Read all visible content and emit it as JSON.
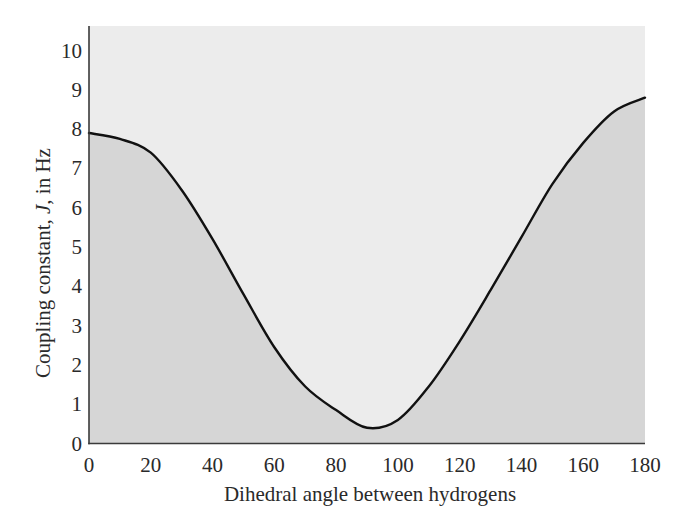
{
  "chart_data": {
    "type": "area",
    "title": "",
    "xlabel": "Dihedral angle between hydrogens",
    "ylabel_parts": [
      "Coupling constant, ",
      "J",
      ", in Hz"
    ],
    "ylabel": "Coupling constant, J, in Hz",
    "xlim": [
      0,
      180
    ],
    "ylim": [
      0,
      10.6
    ],
    "xticks": [
      0,
      20,
      40,
      60,
      80,
      100,
      120,
      140,
      160,
      180
    ],
    "yticks": [
      0,
      1,
      2,
      3,
      4,
      5,
      6,
      7,
      8,
      9,
      10
    ],
    "grid": false,
    "legend": null,
    "series": [
      {
        "name": "Karplus curve",
        "x": [
          0,
          10,
          20,
          30,
          40,
          50,
          60,
          70,
          80,
          90,
          100,
          110,
          120,
          130,
          140,
          150,
          160,
          170,
          180
        ],
        "values": [
          7.9,
          7.75,
          7.4,
          6.45,
          5.2,
          3.8,
          2.45,
          1.45,
          0.85,
          0.4,
          0.6,
          1.45,
          2.6,
          3.9,
          5.25,
          6.6,
          7.65,
          8.45,
          8.8
        ]
      }
    ],
    "colors": {
      "above_curve_fill": "#ececec",
      "below_curve_fill": "#d6d6d6",
      "curve": "#111111",
      "axis": "#3a3a3a"
    }
  }
}
